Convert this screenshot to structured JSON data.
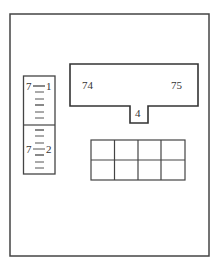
{
  "diagram": {
    "scale": {
      "top_left_label": "7",
      "top_right_label": "1",
      "bottom_left_label": "7",
      "bottom_right_label": "2"
    },
    "t_block": {
      "left_label": "74",
      "right_label": "75",
      "notch_label": "4"
    },
    "grid": {
      "rows": 2,
      "cols": 4
    }
  },
  "colors": {
    "line": "#333333",
    "background": "#ffffff"
  }
}
